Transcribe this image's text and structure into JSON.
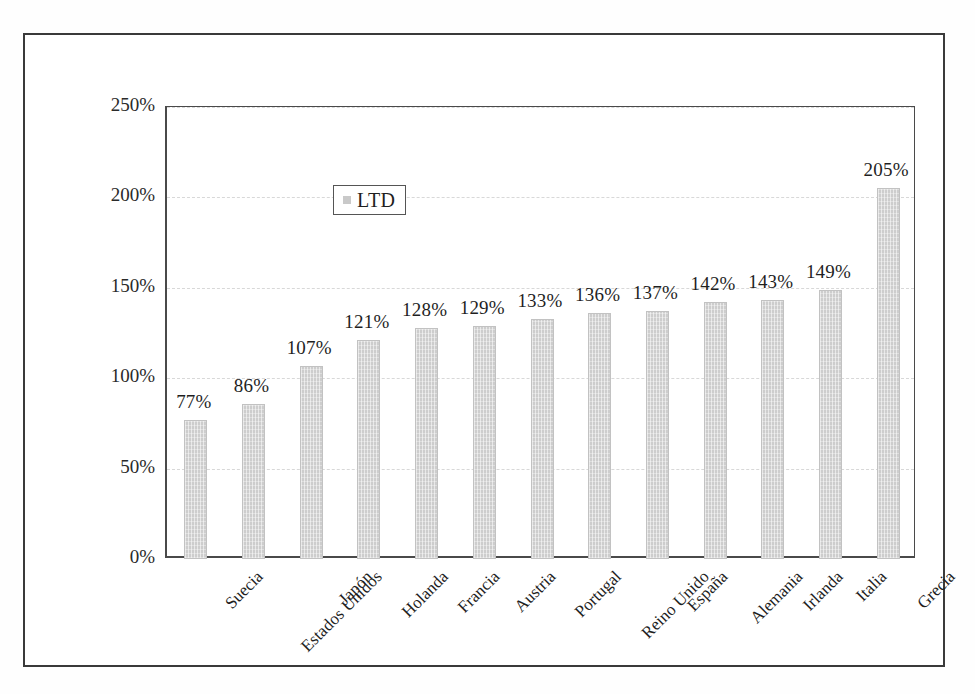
{
  "chart_data": {
    "type": "bar",
    "title": "",
    "subtitle": "",
    "xlabel": "",
    "ylabel": "",
    "ylim": [
      0,
      250
    ],
    "yticks": [
      0,
      50,
      100,
      150,
      200,
      250
    ],
    "ytick_labels": [
      "0%",
      "50%",
      "100%",
      "150%",
      "200%",
      "250%"
    ],
    "grid": true,
    "grid_style": "dashed-horizontal",
    "legend": {
      "position": "top-left-inside",
      "entries": [
        {
          "label": "LTD",
          "color": "#cdcdcd"
        }
      ]
    },
    "categories": [
      "Suecia",
      "Estados Unidos",
      "Japón",
      "Holanda",
      "Francia",
      "Austria",
      "Portugal",
      "Reino Unido",
      "España",
      "Alemania",
      "Irlanda",
      "Italia",
      "Grecia"
    ],
    "series": [
      {
        "name": "LTD",
        "color": "#cdcdcd",
        "values": [
          77,
          86,
          107,
          121,
          128,
          129,
          133,
          136,
          137,
          142,
          143,
          149,
          205
        ],
        "value_labels": [
          "77%",
          "86%",
          "107%",
          "121%",
          "128%",
          "129%",
          "133%",
          "136%",
          "137%",
          "142%",
          "143%",
          "149%",
          "205%"
        ]
      }
    ]
  },
  "colors": {
    "bar_fill": "#cdcdcd",
    "bar_edge": "#c2c2c2",
    "axis": "#4a4a4a",
    "grid": "#d8d8d8",
    "frame": "#3a3a3a",
    "text": "#1f1f1f",
    "background": "#ffffff"
  }
}
